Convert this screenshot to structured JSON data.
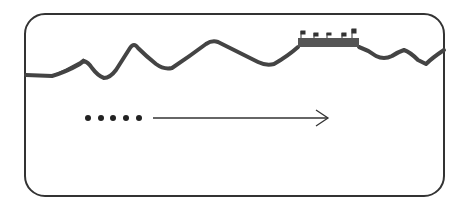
{
  "diagram": {
    "frame": {
      "stroke": "#333333",
      "radius": 20
    },
    "terrain": {
      "stroke": "#444444",
      "description": "mountain ridge profile line"
    },
    "wall": {
      "fill": "#555555",
      "flags": 5
    },
    "dots": {
      "count": 5,
      "color": "#222222"
    },
    "arrow": {
      "stroke": "#333333",
      "direction": "right"
    }
  }
}
